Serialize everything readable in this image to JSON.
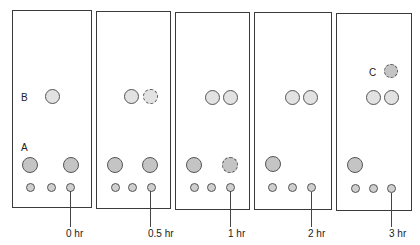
{
  "figure": {
    "type": "TLC time-course diagram",
    "spot_labels": {
      "A": "A",
      "B": "B",
      "C": "C"
    },
    "panels": [
      {
        "time_label": "0 hr",
        "spots": [
          "A lane1",
          "A lane3",
          "B lane2",
          "origin x3"
        ]
      },
      {
        "time_label": "0.5 hr",
        "spots": [
          "A lane1",
          "A lane3",
          "B lane2",
          "B lane3 (faint, dashed)",
          "origin x3"
        ]
      },
      {
        "time_label": "1 hr",
        "spots": [
          "A lane1",
          "A lane3 (faint, dashed)",
          "B lane2",
          "B lane3",
          "origin x3"
        ]
      },
      {
        "time_label": "2 hr",
        "spots": [
          "A lane1",
          "B lane2",
          "B lane3",
          "origin x3"
        ]
      },
      {
        "time_label": "3 hr",
        "spots": [
          "A lane1",
          "B lane2",
          "B lane3",
          "C lane3 (dashed)",
          "origin x3"
        ]
      }
    ]
  },
  "colors": {
    "border": "#3a3a3a",
    "spot_dark": "#c4c4c4",
    "spot_light": "#e2e2e2"
  }
}
